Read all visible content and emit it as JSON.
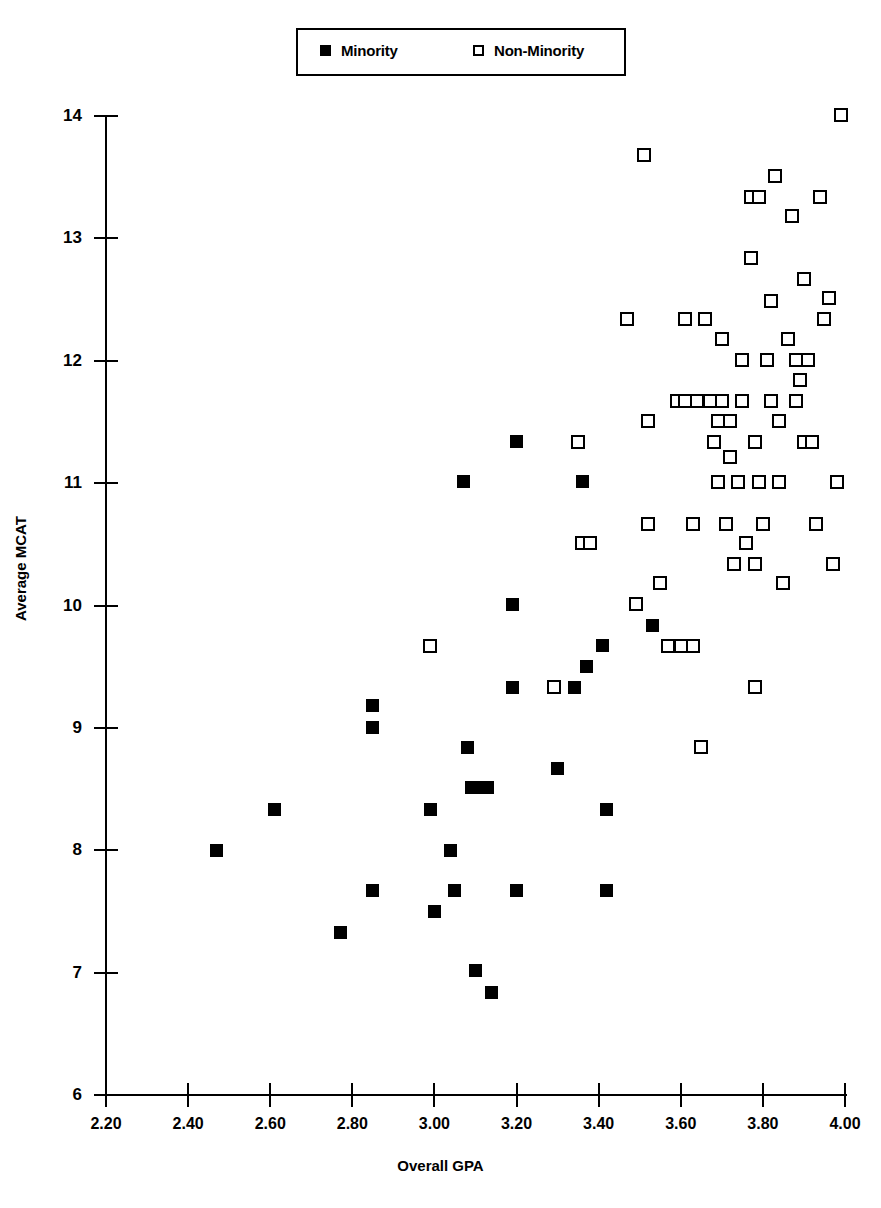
{
  "legend": {
    "entries": [
      {
        "label": "Minority",
        "marker": "filled-square",
        "color": "#000000"
      },
      {
        "label": "Non-Minority",
        "marker": "open-square",
        "color": "#000000"
      }
    ]
  },
  "chart_data": {
    "type": "scatter",
    "title": "",
    "xlabel": "Overall GPA",
    "ylabel": "Average MCAT",
    "xlim": [
      2.2,
      4.0
    ],
    "ylim": [
      6,
      14
    ],
    "xticks": [
      "2.20",
      "2.40",
      "2.60",
      "2.80",
      "3.00",
      "3.20",
      "3.40",
      "3.60",
      "3.80",
      "4.00"
    ],
    "yticks": [
      "6",
      "7",
      "8",
      "9",
      "10",
      "11",
      "12",
      "13",
      "14"
    ],
    "grid": false,
    "legend_position": "top-center",
    "series": [
      {
        "name": "Minority",
        "marker": "filled-square",
        "points": [
          [
            2.47,
            8.0
          ],
          [
            2.61,
            8.33
          ],
          [
            2.77,
            7.33
          ],
          [
            2.85,
            9.18
          ],
          [
            2.85,
            9.0
          ],
          [
            2.85,
            7.67
          ],
          [
            2.99,
            8.33
          ],
          [
            3.0,
            7.5
          ],
          [
            3.04,
            8.0
          ],
          [
            3.05,
            7.67
          ],
          [
            3.07,
            11.01
          ],
          [
            3.08,
            8.84
          ],
          [
            3.09,
            8.51
          ],
          [
            3.1,
            7.02
          ],
          [
            3.12,
            8.51
          ],
          [
            3.13,
            8.51
          ],
          [
            3.14,
            6.84
          ],
          [
            3.19,
            10.01
          ],
          [
            3.19,
            9.33
          ],
          [
            3.2,
            11.34
          ],
          [
            3.2,
            7.67
          ],
          [
            3.3,
            8.67
          ],
          [
            3.34,
            9.33
          ],
          [
            3.36,
            11.01
          ],
          [
            3.37,
            9.5
          ],
          [
            3.41,
            9.67
          ],
          [
            3.42,
            8.33
          ],
          [
            3.42,
            7.67
          ],
          [
            3.53,
            9.84
          ]
        ]
      },
      {
        "name": "Non-Minority",
        "marker": "open-square",
        "points": [
          [
            2.99,
            9.67
          ],
          [
            3.29,
            9.33
          ],
          [
            3.35,
            11.34
          ],
          [
            3.36,
            10.51
          ],
          [
            3.38,
            10.51
          ],
          [
            3.47,
            12.34
          ],
          [
            3.49,
            10.01
          ],
          [
            3.51,
            13.68
          ],
          [
            3.52,
            11.51
          ],
          [
            3.52,
            10.67
          ],
          [
            3.55,
            10.18
          ],
          [
            3.57,
            9.67
          ],
          [
            3.59,
            11.67
          ],
          [
            3.6,
            9.67
          ],
          [
            3.61,
            11.67
          ],
          [
            3.61,
            12.34
          ],
          [
            3.63,
            10.67
          ],
          [
            3.63,
            9.67
          ],
          [
            3.64,
            11.67
          ],
          [
            3.65,
            8.84
          ],
          [
            3.66,
            12.34
          ],
          [
            3.67,
            11.67
          ],
          [
            3.68,
            11.34
          ],
          [
            3.69,
            11.51
          ],
          [
            3.69,
            11.01
          ],
          [
            3.7,
            12.18
          ],
          [
            3.7,
            11.67
          ],
          [
            3.71,
            10.67
          ],
          [
            3.72,
            11.51
          ],
          [
            3.72,
            11.21
          ],
          [
            3.73,
            10.34
          ],
          [
            3.74,
            11.01
          ],
          [
            3.75,
            11.67
          ],
          [
            3.75,
            12.01
          ],
          [
            3.76,
            10.51
          ],
          [
            3.77,
            13.34
          ],
          [
            3.77,
            12.84
          ],
          [
            3.78,
            11.34
          ],
          [
            3.78,
            10.34
          ],
          [
            3.78,
            9.33
          ],
          [
            3.79,
            11.01
          ],
          [
            3.79,
            13.34
          ],
          [
            3.8,
            10.67
          ],
          [
            3.81,
            12.01
          ],
          [
            3.82,
            12.49
          ],
          [
            3.82,
            11.67
          ],
          [
            3.83,
            13.51
          ],
          [
            3.84,
            11.51
          ],
          [
            3.84,
            11.01
          ],
          [
            3.85,
            10.18
          ],
          [
            3.86,
            12.18
          ],
          [
            3.87,
            13.18
          ],
          [
            3.88,
            11.67
          ],
          [
            3.88,
            12.01
          ],
          [
            3.89,
            11.84
          ],
          [
            3.9,
            12.67
          ],
          [
            3.9,
            11.34
          ],
          [
            3.91,
            12.01
          ],
          [
            3.92,
            11.34
          ],
          [
            3.93,
            10.67
          ],
          [
            3.94,
            13.34
          ],
          [
            3.95,
            12.34
          ],
          [
            3.96,
            12.51
          ],
          [
            3.97,
            10.34
          ],
          [
            3.98,
            11.01
          ],
          [
            3.99,
            14.01
          ]
        ]
      }
    ]
  }
}
